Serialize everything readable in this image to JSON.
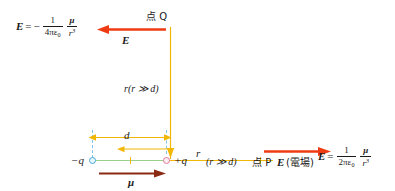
{
  "figure": {
    "type": "electric-dipole-field-diagram",
    "colors": {
      "field_arrow": "#ee3b12",
      "dipole_moment_arrow": "#8a2a12",
      "construction_line": "#f2b705",
      "dipole_axis": "#9bcf8a",
      "dash_guide": "#7fc4e8",
      "negative_charge": "#4aa8d8",
      "positive_charge": "#e07a9a",
      "text": "#1a1a1a"
    }
  },
  "equation_q": {
    "lhs": "E",
    "equals": "=",
    "sign": "−",
    "frac1_num": "1",
    "frac1_den_prefix": "4πε",
    "frac1_den_sub": "0",
    "frac2_num": "μ",
    "frac2_den": "r",
    "frac2_den_exp": "3"
  },
  "equation_p": {
    "lhs": "E",
    "equals": "=",
    "frac1_num": "1",
    "frac1_den_prefix": "2πε",
    "frac1_den_sub": "0",
    "frac2_num": "μ",
    "frac2_den": "r",
    "frac2_den_exp": "3"
  },
  "labels": {
    "point_q": "点 Q",
    "field_at_q": "E",
    "distance_r_vertical": "r",
    "distance_r_vertical_cond": "(r ≫ d)",
    "separation_d": "d",
    "charge_negative": "−q",
    "charge_positive": "+q",
    "distance_r_horizontal": "r",
    "distance_r_horizontal_cond": "(r ≫ d)",
    "point_p": "点 P",
    "field_at_p": "E",
    "field_at_p_annotation": "(電場)",
    "dipole_moment": "μ"
  }
}
